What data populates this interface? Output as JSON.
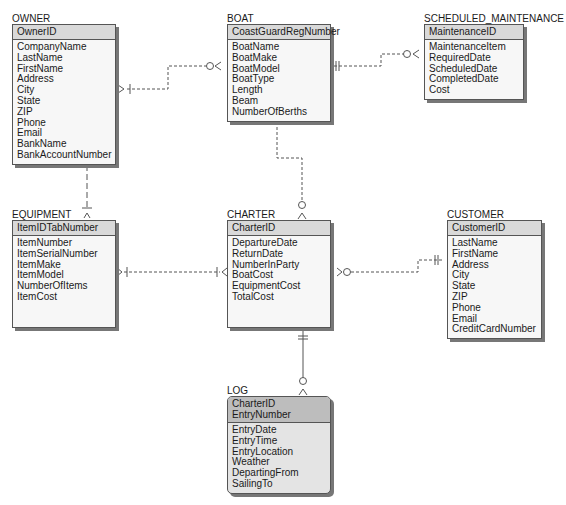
{
  "diagram": {
    "type": "crows-foot-er-diagram",
    "entities": [
      {
        "id": "owner",
        "name": "OWNER",
        "keys": [
          "OwnerID"
        ],
        "attributes": [
          "CompanyName",
          "LastName",
          "FirstName",
          "Address",
          "City",
          "State",
          "ZIP",
          "Phone",
          "Email",
          "BankName",
          "BankAccountNumber"
        ]
      },
      {
        "id": "boat",
        "name": "BOAT",
        "keys": [
          "CoastGuardRegNumber"
        ],
        "attributes": [
          "BoatName",
          "BoatMake",
          "BoatModel",
          "BoatType",
          "Length",
          "Beam",
          "NumberOfBerths"
        ]
      },
      {
        "id": "scheduled_maintenance",
        "name": "SCHEDULED_MAINTENANCE",
        "keys": [
          "MaintenanceID"
        ],
        "attributes": [
          "MaintenanceItem",
          "RequiredDate",
          "ScheduledDate",
          "CompletedDate",
          "Cost"
        ]
      },
      {
        "id": "equipment",
        "name": "EQUIPMENT",
        "keys": [
          "ItemIDTabNumber"
        ],
        "attributes": [
          "ItemNumber",
          "ItemSerialNumber",
          "ItemMake",
          "ItemModel",
          "NumberOfItems",
          "ItemCost"
        ]
      },
      {
        "id": "charter",
        "name": "CHARTER",
        "keys": [
          "CharterID"
        ],
        "attributes": [
          "DepartureDate",
          "ReturnDate",
          "NumberInParty",
          "BoatCost",
          "EquipmentCost",
          "TotalCost"
        ]
      },
      {
        "id": "customer",
        "name": "CUSTOMER",
        "keys": [
          "CustomerID"
        ],
        "attributes": [
          "LastName",
          "FirstName",
          "Address",
          "City",
          "State",
          "ZIP",
          "Phone",
          "Email",
          "CreditCardNumber"
        ]
      },
      {
        "id": "log",
        "name": "LOG",
        "keys": [
          "CharterID",
          "EntryNumber"
        ],
        "attributes": [
          "EntryDate",
          "EntryTime",
          "EntryLocation",
          "Weather",
          "DepartingFrom",
          "SailingTo"
        ]
      }
    ],
    "relationships": [
      {
        "from": "OWNER",
        "to": "BOAT",
        "from_cardinality": "one-or-many",
        "to_cardinality": "zero-or-many",
        "identifying": false
      },
      {
        "from": "BOAT",
        "to": "SCHEDULED_MAINTENANCE",
        "from_cardinality": "exactly-one",
        "to_cardinality": "zero-or-many",
        "identifying": false
      },
      {
        "from": "BOAT",
        "to": "CHARTER",
        "from_cardinality": "exactly-one",
        "to_cardinality": "zero-or-many",
        "identifying": false
      },
      {
        "from": "OWNER",
        "to": "EQUIPMENT",
        "from_cardinality": "one-or-many",
        "to_cardinality": "one-or-many",
        "identifying": false
      },
      {
        "from": "EQUIPMENT",
        "to": "CHARTER",
        "from_cardinality": "one-or-many",
        "to_cardinality": "one-or-many",
        "identifying": false
      },
      {
        "from": "CHARTER",
        "to": "CUSTOMER",
        "from_cardinality": "zero-or-many",
        "to_cardinality": "exactly-one",
        "identifying": false
      },
      {
        "from": "CHARTER",
        "to": "LOG",
        "from_cardinality": "exactly-one",
        "to_cardinality": "zero-or-many",
        "identifying": true
      }
    ]
  }
}
